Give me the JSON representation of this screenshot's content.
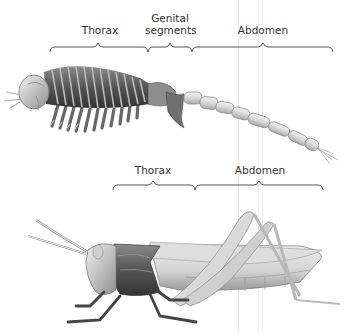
{
  "figure": {
    "top_specimen": {
      "name": "ancestral-arthropod",
      "labels": {
        "thorax": "Thorax",
        "genital_line1": "Genital",
        "genital_line2": "segments",
        "abdomen": "Abdomen"
      }
    },
    "bottom_specimen": {
      "name": "grasshopper",
      "labels": {
        "thorax": "Thorax",
        "abdomen": "Abdomen"
      }
    }
  }
}
